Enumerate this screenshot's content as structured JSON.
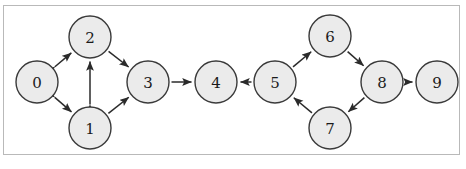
{
  "diagram": {
    "background_color": "#ffffff",
    "frame_color": "#b9b9b9",
    "node_fill": "#ebebeb",
    "node_stroke": "#3a3a3a",
    "edge_color": "#2b2b2b",
    "node_radius": 21,
    "nodes": [
      {
        "id": "0",
        "label": "0",
        "x": 37,
        "y": 82
      },
      {
        "id": "1",
        "label": "1",
        "x": 90,
        "y": 128
      },
      {
        "id": "2",
        "label": "2",
        "x": 90,
        "y": 37
      },
      {
        "id": "3",
        "label": "3",
        "x": 148,
        "y": 82
      },
      {
        "id": "4",
        "label": "4",
        "x": 216,
        "y": 82
      },
      {
        "id": "5",
        "label": "5",
        "x": 275,
        "y": 82
      },
      {
        "id": "6",
        "label": "6",
        "x": 330,
        "y": 36
      },
      {
        "id": "7",
        "label": "7",
        "x": 330,
        "y": 128
      },
      {
        "id": "8",
        "label": "8",
        "x": 382,
        "y": 82
      },
      {
        "id": "9",
        "label": "9",
        "x": 437,
        "y": 82
      }
    ],
    "edges": [
      {
        "from": "0",
        "to": "2",
        "directed": "both"
      },
      {
        "from": "0",
        "to": "1",
        "directed": "both"
      },
      {
        "from": "1",
        "to": "2",
        "directed": "both"
      },
      {
        "from": "2",
        "to": "3",
        "directed": "forward"
      },
      {
        "from": "1",
        "to": "3",
        "directed": "forward"
      },
      {
        "from": "3",
        "to": "4",
        "directed": "forward"
      },
      {
        "from": "5",
        "to": "4",
        "directed": "forward"
      },
      {
        "from": "5",
        "to": "6",
        "directed": "forward"
      },
      {
        "from": "6",
        "to": "8",
        "directed": "forward"
      },
      {
        "from": "8",
        "to": "7",
        "directed": "forward"
      },
      {
        "from": "7",
        "to": "5",
        "directed": "forward"
      },
      {
        "from": "8",
        "to": "9",
        "directed": "forward"
      }
    ]
  }
}
